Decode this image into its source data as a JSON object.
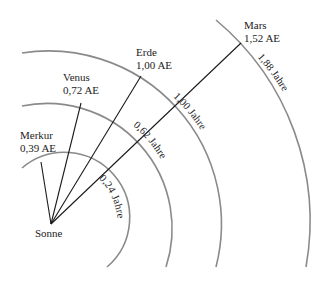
{
  "diagram": {
    "type": "orbit-diagram",
    "center": {
      "label": "Sonne"
    },
    "colors": {
      "orbit": "#8a8a8a",
      "ray": "#1a1a1a",
      "text": "#222222"
    },
    "planets": [
      {
        "name": "Merkur",
        "distance": "0,39 AE",
        "period": "0,24 Jahre"
      },
      {
        "name": "Venus",
        "distance": "0,72 AE",
        "period": "0,62 Jahre"
      },
      {
        "name": "Erde",
        "distance": "1,00 AE",
        "period": "1,00 Jahre"
      },
      {
        "name": "Mars",
        "distance": "1,52 AE",
        "period": "1,88 Jahre"
      }
    ]
  }
}
